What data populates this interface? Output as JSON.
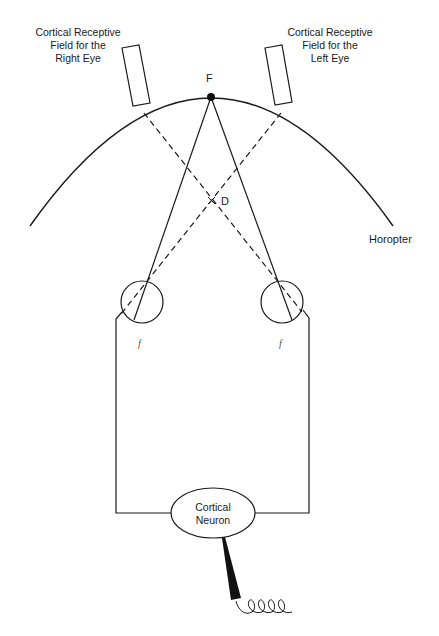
{
  "diagram": {
    "type": "binocular-disparity-schematic",
    "labels": {
      "right_eye_field": [
        "Cortical Receptive",
        "Field for the",
        "Right Eye"
      ],
      "left_eye_field": [
        "Cortical Receptive",
        "Field for the",
        "Left Eye"
      ],
      "fixation_point": "F",
      "disparate_point": "D",
      "horopter": "Horopter",
      "neuron": [
        "Cortical",
        "Neuron"
      ],
      "fovea_left": "f",
      "fovea_right": "f"
    },
    "elements": [
      {
        "name": "horopter-arc",
        "kind": "arc"
      },
      {
        "name": "fixation-point",
        "kind": "dot"
      },
      {
        "name": "right-eye-receptive-field",
        "kind": "rectangle"
      },
      {
        "name": "left-eye-receptive-field",
        "kind": "rectangle"
      },
      {
        "name": "left-eye",
        "kind": "circle"
      },
      {
        "name": "right-eye",
        "kind": "circle"
      },
      {
        "name": "fixation-lines",
        "kind": "solid-lines"
      },
      {
        "name": "disparity-lines",
        "kind": "dashed-lines"
      },
      {
        "name": "neural-pathways",
        "kind": "wires"
      },
      {
        "name": "cortical-neuron",
        "kind": "ellipse"
      },
      {
        "name": "recording-electrode",
        "kind": "wedge-and-coil"
      }
    ],
    "colors": {
      "stroke": "#1a1a1a",
      "background": "#ffffff"
    }
  }
}
